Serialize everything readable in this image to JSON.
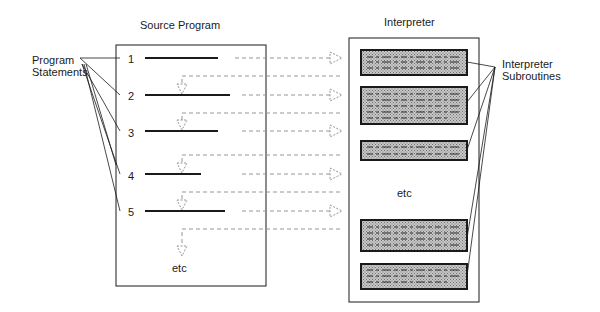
{
  "diagram": {
    "source_title": "Source Program",
    "interpreter_title": "Interpreter",
    "program_statements_label": [
      "Program",
      "Statements"
    ],
    "interpreter_subroutines_label": [
      "Interpreter",
      "Subroutines"
    ],
    "statement_numbers": [
      "1",
      "2",
      "3",
      "4",
      "5"
    ],
    "source_etc": "etc",
    "interpreter_etc": "etc",
    "colors": {
      "line": "#1a1a1a",
      "dashed": "#888888",
      "subroutine_fill": "#a8a8a8",
      "background": "#ffffff"
    }
  }
}
